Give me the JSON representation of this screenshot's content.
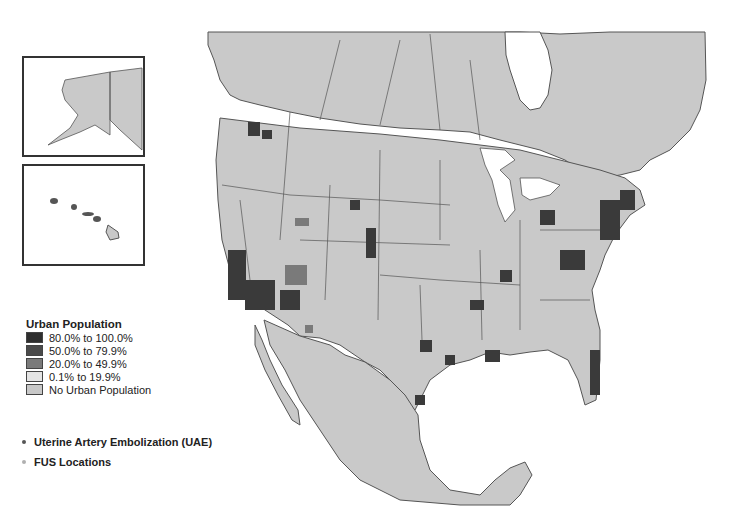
{
  "map": {
    "type": "choropleth",
    "region": "North America (United States counties)",
    "insets": [
      "Alaska",
      "Hawaii"
    ]
  },
  "legend": {
    "title": "Urban Population",
    "classes": [
      {
        "label": "80.0% to 100.0%",
        "color": "#2e2e2e"
      },
      {
        "label": "50.0% to 79.9%",
        "color": "#4a4a4a"
      },
      {
        "label": "20.0% to 49.9%",
        "color": "#7a7a7a"
      },
      {
        "label": "0.1% to 19.9%",
        "color": "#dcdcdc"
      },
      {
        "label": "No Urban Population",
        "color": "#c8c8c8"
      }
    ]
  },
  "points": {
    "items": [
      {
        "label": "Uterine Artery Embolization (UAE)",
        "color": "#555555"
      },
      {
        "label": "FUS Locations",
        "color": "#b0b0b0"
      }
    ]
  },
  "colors": {
    "land": "#c9c9c9",
    "water": "#ffffff",
    "border": "#555555"
  }
}
